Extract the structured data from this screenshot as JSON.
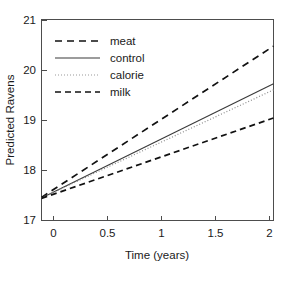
{
  "chart_data": {
    "type": "line",
    "title": "",
    "xlabel": "Time (years)",
    "ylabel": "Predicted Ravens",
    "xlim": [
      -0.12,
      2.12
    ],
    "ylim": [
      17,
      21
    ],
    "xticks": [
      "0",
      "0.5",
      "1",
      "1.5",
      "2"
    ],
    "xtick_values": [
      0,
      0.5,
      1,
      1.5,
      2
    ],
    "yticks": [
      "17",
      "18",
      "19",
      "20",
      "21"
    ],
    "ytick_values": [
      17,
      18,
      19,
      20,
      21
    ],
    "grid": false,
    "legend_position": "top-left",
    "x": [
      -0.12,
      2.12
    ],
    "series": [
      {
        "name": "meat",
        "label": "meat",
        "style": "dashed",
        "dasharray": "7,5",
        "width": 1.7,
        "color": "#111111",
        "values": [
          17.46,
          20.47
        ]
      },
      {
        "name": "control",
        "label": "control",
        "style": "solid",
        "dasharray": "none",
        "width": 1.1,
        "color": "#3a3a3a",
        "values": [
          17.45,
          19.72
        ]
      },
      {
        "name": "calorie",
        "label": "calorie",
        "style": "dotted",
        "dasharray": "1,2",
        "width": 1.2,
        "color": "#8c8c8c",
        "values": [
          17.45,
          19.6
        ]
      },
      {
        "name": "milk",
        "label": "milk",
        "style": "dashed",
        "dasharray": "6,4",
        "width": 1.7,
        "color": "#111111",
        "values": [
          17.44,
          19.04
        ]
      }
    ]
  },
  "legend": {
    "entries": [
      {
        "label": "meat"
      },
      {
        "label": "control"
      },
      {
        "label": "calorie"
      },
      {
        "label": "milk"
      }
    ]
  },
  "axes": {
    "x_title": "Time (years)",
    "y_title": "Predicted Ravens",
    "x_tick_labels": [
      "0",
      "0.5",
      "1",
      "1.5",
      "2"
    ],
    "y_tick_labels": [
      "17",
      "18",
      "19",
      "20",
      "21"
    ]
  }
}
